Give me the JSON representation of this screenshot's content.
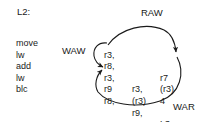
{
  "diagram": {
    "title_label": "L2:",
    "stroke_color": "#1a1a1a",
    "text_color": "#1a1a1a",
    "background_color": "#ffffff",
    "instructions": [
      {
        "mnemonic": "move",
        "op1": "r3,",
        "op2": "",
        "op3": "r7"
      },
      {
        "mnemonic": "lw",
        "op1": "r8,",
        "op2": "",
        "op3": "(r3)"
      },
      {
        "mnemonic": "add",
        "op1": "r3,",
        "op2": "r3,",
        "op3": "4"
      },
      {
        "mnemonic": "lw",
        "op1": "r9",
        "op2": "(r3)",
        "op3": ""
      },
      {
        "mnemonic": "blc",
        "op1": "r8,",
        "op2": "r9,",
        "op3": "L3"
      }
    ],
    "dependencies": [
      {
        "name": "raw",
        "label": "RAW",
        "from": "move r3",
        "to": "lw (r3)"
      },
      {
        "name": "waw",
        "label": "WAW",
        "from": "move r3",
        "to": "add r3"
      },
      {
        "name": "war",
        "label": "WAR",
        "from": "lw (r3)",
        "to": "add r3"
      }
    ]
  }
}
